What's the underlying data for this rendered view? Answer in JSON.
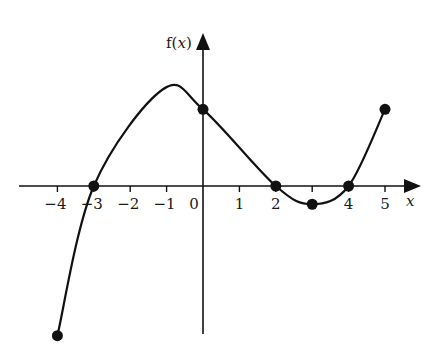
{
  "chart_data": {
    "type": "line",
    "title": "",
    "xlabel": "x",
    "ylabel": "f(x)",
    "ylabel_parts": {
      "prefix": "f(",
      "var": "x",
      "suffix": ")"
    },
    "xlim": [
      -4,
      5
    ],
    "ylim": [
      -4.1,
      4.2
    ],
    "grid": false,
    "x_ticks": [
      -4,
      -3,
      -2,
      -1,
      0,
      1,
      2,
      3,
      4,
      5
    ],
    "x_tick_labels": [
      "−4",
      "−3",
      "−2",
      "−1",
      "0",
      "1",
      "2",
      "",
      "4",
      "5"
    ],
    "curve_points": [
      {
        "x": -4,
        "y": -4.1
      },
      {
        "x": -3,
        "y": 0
      },
      {
        "x": -1.1,
        "y": 2.65
      },
      {
        "x": 0,
        "y": 2.1
      },
      {
        "x": 2,
        "y": 0
      },
      {
        "x": 3,
        "y": -0.5
      },
      {
        "x": 4,
        "y": 0
      },
      {
        "x": 5,
        "y": 2.1
      }
    ],
    "marked_points": [
      {
        "x": -4,
        "y": -4.1
      },
      {
        "x": -3,
        "y": 0
      },
      {
        "x": 0,
        "y": 2.1
      },
      {
        "x": 2,
        "y": 0
      },
      {
        "x": 3,
        "y": -0.5
      },
      {
        "x": 4,
        "y": 0
      },
      {
        "x": 5,
        "y": 2.1
      }
    ],
    "line_color": "#111111"
  }
}
